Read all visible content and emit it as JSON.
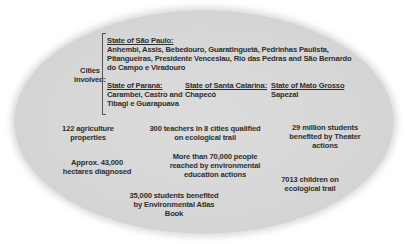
{
  "diagram": {
    "shape": "ellipse",
    "fill_color": "#d8d8d8",
    "text_color": "#2e2e2e",
    "cities": {
      "label_line1": "Cities",
      "label_line2": "involved:",
      "sao_paulo": {
        "heading": "State of São Paulo:",
        "line1": "Anhembi, Assis, Bebedouro, Guaratinguetá, Pedrinhas Paulista,",
        "line2": "Pitangueiras, Presidente Venceslau, Rio das Pedras and São Bernardo",
        "line3": "do Campo e Viradouro"
      },
      "parana": {
        "heading": "State of Paraná:",
        "line1": "Carambeí, Castro and",
        "line2": "Tibagi e Guarapuava"
      },
      "santa_catarina": {
        "heading": "State of Santa Catarina:",
        "line1": "Chapecó"
      },
      "mato_grosso": {
        "heading": "State of Mato Grosso",
        "line1": "Sapezal"
      }
    },
    "stats": [
      {
        "line1": "122 agriculture",
        "line2": "properties"
      },
      {
        "line1": "300 teachers in 8 cities qualified",
        "line2": "on ecological trail"
      },
      {
        "line1": "29 million  students",
        "line2": "benefited by Theater",
        "line3": "actions"
      },
      {
        "line1": "Approx. 43,000",
        "line2": "hectares diagnosed"
      },
      {
        "line1": "More than 70,000 people",
        "line2": "reached by environmental",
        "line3": "education actions"
      },
      {
        "line1": "7013 children on",
        "line2": "ecological trail"
      },
      {
        "line1": "35,000 students benefited",
        "line2": "by Environmental Atlas",
        "line3": "Book"
      }
    ]
  }
}
